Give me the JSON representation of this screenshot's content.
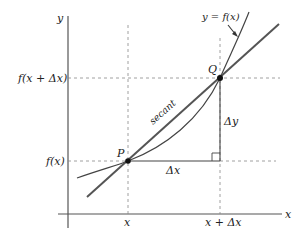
{
  "diagram": {
    "curve_label": "y = f(x)",
    "secant_label": "secant",
    "axes": {
      "x_label": "x",
      "y_label": "y"
    },
    "points": {
      "p_label": "P",
      "q_label": "Q"
    },
    "ticks": {
      "x1": "x",
      "x2": "x + Δx",
      "y1": "f(x)",
      "y2": "f(x + Δx)"
    },
    "increments": {
      "dx": "Δx",
      "dy": "Δy"
    },
    "colors": {
      "curve": "#444444",
      "secant": "#555555",
      "axis": "#555555",
      "dashed": "#888888",
      "point": "#111111"
    }
  }
}
